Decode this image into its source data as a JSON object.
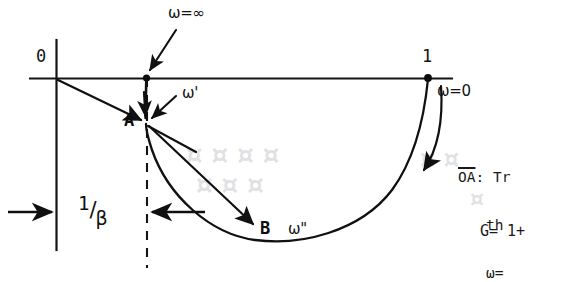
{
  "figure": {
    "type": "nyquist-polar-plot",
    "background_color": "#ffffff",
    "ink_color": "#101010",
    "axis": {
      "origin_label": "0",
      "unity_label": "1",
      "real_axis_y": 78,
      "origin_x": 56,
      "unity_x": 428
    },
    "points": [
      {
        "name": "A",
        "label": "A",
        "x": 146,
        "y": 123
      },
      {
        "name": "B",
        "label": "B",
        "x": 258,
        "y": 227
      },
      {
        "name": "inf",
        "label": "",
        "x": 146,
        "y": 78
      },
      {
        "name": "one",
        "label": "",
        "x": 428,
        "y": 78
      }
    ],
    "annotations": [
      {
        "id": "omega-infinity",
        "text": "ω=∞",
        "x": 168,
        "y": 6,
        "points_to": "inf"
      },
      {
        "id": "omega-prime",
        "text": "ω'",
        "x": 182,
        "y": 93,
        "points_to": "A"
      },
      {
        "id": "omega-zero",
        "text": "ω=0",
        "x": 437,
        "y": 88,
        "points_to": "one"
      },
      {
        "id": "omega-double",
        "text": "ω\"",
        "x": 288,
        "y": 228,
        "points_to": "B"
      },
      {
        "id": "point-a-label",
        "text": "A",
        "x": 124,
        "y": 114,
        "points_to": "A"
      },
      {
        "id": "point-b-label",
        "text": "B",
        "x": 262,
        "y": 226,
        "points_to": "B"
      }
    ],
    "dimension": {
      "label_numerator": "1",
      "label_slash": "/",
      "label_denominator": "β",
      "full_text": "1/β",
      "left_arrow_from_x": 8,
      "left_arrow_to_x": 56,
      "right_arrow_from_x": 205,
      "right_arrow_to_x": 150,
      "arrow_y": 212
    }
  },
  "notes": {
    "lines": [
      {
        "id": "note-line-1",
        "overline_token": "OA",
        "text": ": Tr"
      },
      {
        "id": "note-line-2",
        "overline_token": "",
        "text": "th"
      },
      {
        "id": "note-line-3",
        "overline_token": "",
        "text": "ω="
      }
    ],
    "gain_line": "G= 1+"
  },
  "ghost_text": [
    {
      "id": "ghost-1",
      "text": "¤ ¤ ¤ ¤",
      "x": 186,
      "y": 152,
      "size": 26
    },
    {
      "id": "ghost-2",
      "text": "¤ ¤ ¤",
      "x": 196,
      "y": 182,
      "size": 26
    },
    {
      "id": "ghost-3",
      "text": "¤ ¤",
      "x": 420,
      "y": 158,
      "size": 24
    },
    {
      "id": "ghost-4",
      "text": "¤",
      "x": 470,
      "y": 196,
      "size": 22
    }
  ]
}
